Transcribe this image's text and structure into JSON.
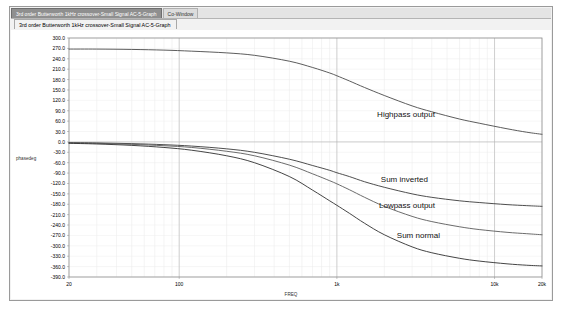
{
  "window": {
    "caption_tabs": [
      {
        "label": "3rd order Butterworth 1kHz crossover-Small Signal AC-5-Graph",
        "state": "active"
      },
      {
        "label": "Co-Window",
        "state": "inactive"
      }
    ],
    "document_tab": "3rd order Butterworth 1kHz crossover-Small Signal AC-5-Graph"
  },
  "chart_data": {
    "type": "line",
    "title": "3rd order Butterworth 1kHz crossover-Small Signal AC-5-Graph",
    "xlabel": "FREQ",
    "ylabel": "phasedeg",
    "xscale": "log",
    "xlim": [
      20,
      20000
    ],
    "ylim": [
      -390,
      300
    ],
    "grid": true,
    "legend_position": "inline-annotations",
    "xticks": [
      "20",
      "100",
      "1k",
      "10k",
      "20k"
    ],
    "xtick_values": [
      20,
      100,
      1000,
      10000,
      20000
    ],
    "yticks": [
      "300.0",
      "270.0",
      "240.0",
      "210.0",
      "180.0",
      "150.0",
      "120.0",
      "90.0",
      "60.0",
      "30.0",
      "0.0",
      "-30.0",
      "-60.0",
      "-90.0",
      "-120.0",
      "-150.0",
      "-180.0",
      "-210.0",
      "-240.0",
      "-270.0",
      "-300.0",
      "-330.0",
      "-360.0",
      "-390.0"
    ],
    "ytick_values": [
      300,
      270,
      240,
      210,
      180,
      150,
      120,
      90,
      60,
      30,
      0,
      -30,
      -60,
      -90,
      -120,
      -150,
      -180,
      -210,
      -240,
      -270,
      -300,
      -330,
      -360,
      -390
    ],
    "series": [
      {
        "name": "Highpass output",
        "label_x": 1800,
        "label_y": 72,
        "color": "#4a4a4a",
        "x": [
          20,
          30,
          50,
          80,
          120,
          200,
          300,
          500,
          700,
          900,
          1000,
          1200,
          1500,
          2000,
          3000,
          4000,
          6000,
          8000,
          12000,
          16000,
          20000
        ],
        "y": [
          268,
          268,
          267,
          265,
          262,
          257,
          250,
          233,
          215,
          199,
          191,
          176,
          157,
          134,
          104,
          87,
          66,
          54,
          38,
          28,
          22
        ]
      },
      {
        "name": "Sum inverted",
        "label_x": 1900,
        "label_y": -115,
        "color": "#3a3a3a",
        "x": [
          20,
          30,
          50,
          80,
          120,
          200,
          300,
          500,
          700,
          900,
          1000,
          1200,
          1500,
          2000,
          3000,
          4000,
          6000,
          8000,
          12000,
          16000,
          20000
        ],
        "y": [
          -2,
          -3,
          -5,
          -8,
          -12,
          -20,
          -30,
          -50,
          -68,
          -82,
          -89,
          -100,
          -115,
          -131,
          -150,
          -160,
          -170,
          -175,
          -181,
          -184,
          -186
        ]
      },
      {
        "name": "Lowpass output",
        "label_x": 1850,
        "label_y": -190,
        "color": "#5a5a5a",
        "x": [
          20,
          30,
          50,
          80,
          120,
          200,
          300,
          500,
          700,
          900,
          1000,
          1200,
          1500,
          2000,
          3000,
          4000,
          6000,
          8000,
          12000,
          16000,
          20000
        ],
        "y": [
          -3,
          -4,
          -7,
          -11,
          -16,
          -27,
          -40,
          -67,
          -92,
          -112,
          -121,
          -138,
          -160,
          -186,
          -215,
          -230,
          -245,
          -253,
          -261,
          -265,
          -268
        ]
      },
      {
        "name": "Sum normal",
        "label_x": 2400,
        "label_y": -278,
        "color": "#2f2f2f",
        "x": [
          20,
          30,
          50,
          80,
          120,
          200,
          300,
          500,
          700,
          900,
          1000,
          1200,
          1500,
          2000,
          3000,
          4000,
          6000,
          8000,
          12000,
          16000,
          20000
        ],
        "y": [
          -4,
          -6,
          -10,
          -16,
          -24,
          -40,
          -60,
          -100,
          -139,
          -170,
          -183,
          -206,
          -235,
          -268,
          -303,
          -320,
          -336,
          -344,
          -352,
          -356,
          -358
        ]
      }
    ]
  }
}
